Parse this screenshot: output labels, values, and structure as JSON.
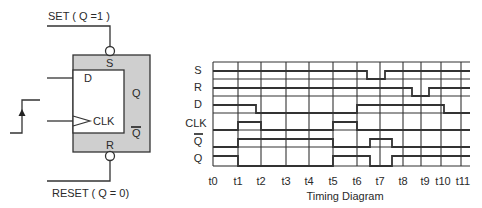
{
  "flipflop": {
    "set_label": "SET ( Q =1 )",
    "reset_label": "RESET ( Q = 0)",
    "pin_s": "S",
    "pin_r": "R",
    "pin_d": "D",
    "pin_clk": "CLK",
    "out_q": "Q",
    "out_qbar": "Q",
    "icons": [
      "rising-edge-arrow-icon",
      "clock-triangle-icon",
      "inversion-bubble-icon"
    ],
    "colors": {
      "body_fill": "#cfcfcf",
      "inner_fill": "#ffffff",
      "stroke": "#333333"
    }
  },
  "timing": {
    "title": "Timing Diagram",
    "signals": [
      "S",
      "R",
      "D",
      "CLK",
      "Q",
      "Q"
    ],
    "ticks": [
      "t0",
      "t1",
      "t2",
      "t3",
      "t4",
      "t5",
      "t6",
      "t7",
      "t8",
      "t9",
      "t10",
      "t11"
    ]
  }
}
